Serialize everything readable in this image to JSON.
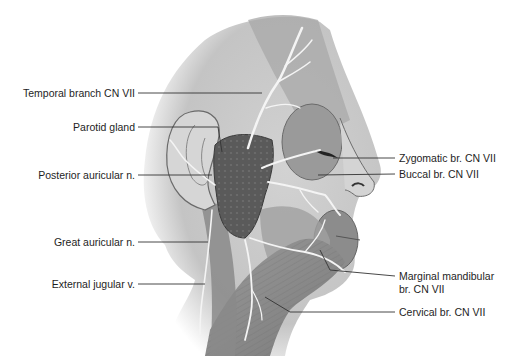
{
  "figure": {
    "labels_left": [
      {
        "id": "temporal",
        "text": "Temporal branch CN VII"
      },
      {
        "id": "parotid",
        "text": "Parotid gland"
      },
      {
        "id": "posterior-auricular",
        "text": "Posterior auricular n."
      },
      {
        "id": "great-auricular",
        "text": "Great auricular n."
      },
      {
        "id": "external-jugular",
        "text": "External jugular v."
      }
    ],
    "labels_right": [
      {
        "id": "zygomatic",
        "text": "Zygomatic br. CN VII"
      },
      {
        "id": "buccal",
        "text": "Buccal br. CN VII"
      },
      {
        "id": "marginal-mandibular-1",
        "text": "Marginal mandibular"
      },
      {
        "id": "marginal-mandibular-2",
        "text": "br. CN VII"
      },
      {
        "id": "cervical",
        "text": "Cervical br. CN VII"
      }
    ]
  },
  "colors": {
    "skin": "#c9c9c9",
    "skin_light": "#dcdcdc",
    "muscle": "#8e8e8e",
    "gland": "#5a5a5a",
    "nerve": "#f4f4f4",
    "leader": "#333333",
    "text": "#1e1e1e"
  }
}
